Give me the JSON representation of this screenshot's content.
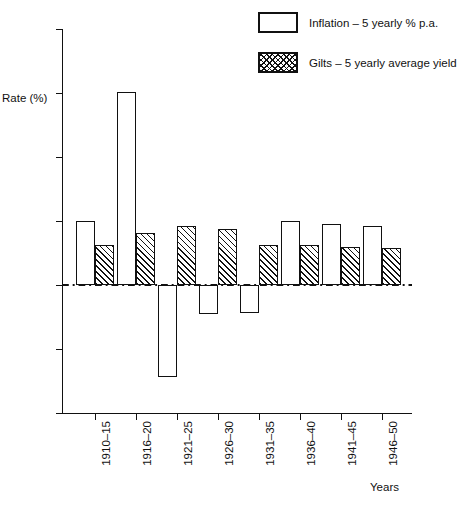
{
  "top_crop_text": "",
  "legend": {
    "position": "top-right",
    "entries": [
      {
        "label": "Inflation – 5 yearly % p.a.",
        "swatch": "open-box-swatch"
      },
      {
        "label": "Gilts – 5 yearly average yield",
        "swatch": "hatched-box-swatch"
      }
    ]
  },
  "axis": {
    "ylabel": "Rate (%)",
    "xlabel": "Years",
    "yticks": [
      "20",
      "15",
      "10",
      "5",
      "0",
      "–5",
      "–10"
    ]
  },
  "chart_data": {
    "type": "bar",
    "title": "",
    "xlabel": "Years",
    "ylabel": "Rate (%)",
    "ylim": [
      -10,
      20
    ],
    "ytick_values": [
      20,
      15,
      10,
      5,
      0,
      -5,
      -10
    ],
    "grid": false,
    "legend_position": "top-right",
    "zero_reference_line": true,
    "categories": [
      "1910–15",
      "1916–20",
      "1921–25",
      "1926–30",
      "1931–35",
      "1936–40",
      "1941–45",
      "1946–50"
    ],
    "series": [
      {
        "name": "Inflation – 5 yearly % p.a.",
        "style": "open",
        "values": [
          5.0,
          15.1,
          -7.2,
          -2.3,
          -2.2,
          5.0,
          4.8,
          4.6
        ]
      },
      {
        "name": "Gilts – 5 yearly average yield",
        "style": "hatched",
        "values": [
          3.1,
          4.1,
          4.6,
          4.4,
          3.1,
          3.1,
          3.0,
          2.9
        ]
      }
    ]
  }
}
